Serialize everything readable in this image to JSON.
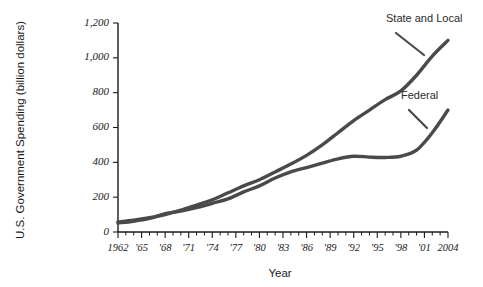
{
  "chart_data": {
    "type": "line",
    "title": "",
    "subtitle": "",
    "xlabel": "Year",
    "ylabel": "U.S. Government Spending (billion dollars)",
    "xlim": [
      1962,
      2004
    ],
    "ylim": [
      0,
      1200
    ],
    "y_ticks": [
      0,
      200,
      400,
      600,
      800,
      1000,
      1200
    ],
    "y_tick_labels": [
      "0",
      "200",
      "400",
      "600",
      "800",
      "1,000",
      "1,200"
    ],
    "x_tick_values": [
      1962,
      1965,
      1968,
      1971,
      1974,
      1977,
      1980,
      1983,
      1986,
      1989,
      1992,
      1995,
      1998,
      2001,
      2004
    ],
    "x_tick_labels": [
      "1962",
      "'65",
      "'68",
      "'71",
      "'74",
      "'77",
      "'80",
      "'83",
      "'86",
      "'89",
      "'92",
      "'95",
      "'98",
      "'01",
      "2004"
    ],
    "x_minor_step": 1,
    "grid": false,
    "legend_position": "inline-annotation",
    "series": [
      {
        "name": "State and Local",
        "color": "#4a4a4a",
        "x": [
          1962,
          1964,
          1966,
          1968,
          1970,
          1972,
          1974,
          1976,
          1978,
          1980,
          1982,
          1984,
          1986,
          1988,
          1990,
          1992,
          1994,
          1996,
          1998,
          2000,
          2002,
          2004
        ],
        "values": [
          58,
          68,
          82,
          100,
          125,
          155,
          185,
          225,
          265,
          300,
          345,
          390,
          440,
          500,
          570,
          640,
          700,
          760,
          810,
          900,
          1010,
          1100
        ]
      },
      {
        "name": "Federal",
        "color": "#4a4a4a",
        "x": [
          1962,
          1964,
          1966,
          1968,
          1970,
          1972,
          1974,
          1976,
          1978,
          1980,
          1982,
          1984,
          1986,
          1988,
          1990,
          1992,
          1994,
          1996,
          1998,
          2000,
          2002,
          2004
        ],
        "values": [
          52,
          62,
          78,
          105,
          120,
          140,
          165,
          190,
          230,
          265,
          310,
          345,
          370,
          395,
          420,
          435,
          430,
          428,
          435,
          470,
          570,
          700
        ]
      }
    ],
    "annotations": [
      {
        "text": "State and Local",
        "series": "State and Local"
      },
      {
        "text": "Federal",
        "series": "Federal"
      }
    ]
  }
}
